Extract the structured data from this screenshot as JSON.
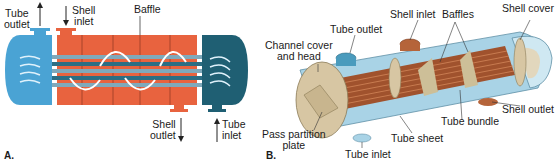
{
  "figure_a": {
    "panel_label": "A.",
    "labels": {
      "tube_outlet": [
        "Tube",
        "outlet"
      ],
      "shell_inlet": [
        "Shell",
        "inlet"
      ],
      "baffle": "Baffle",
      "shell_outlet": [
        "Shell",
        "outlet"
      ],
      "tube_inlet": [
        "Tube",
        "inlet"
      ]
    },
    "colors": {
      "tube_inlet_head": "#1f5f73",
      "tube_outlet_head": "#4aa3d4",
      "shell": "#e8633f",
      "tubes": "#2c6e84",
      "baffle": "#a8452a"
    }
  },
  "figure_b": {
    "panel_label": "B.",
    "labels": {
      "tube_outlet": "Tube outlet",
      "shell_inlet": "Shell inlet",
      "baffles": "Baffles",
      "shell_cover": "Shell cover",
      "channel_cover": [
        "Channel cover",
        "and head"
      ],
      "pass_partition": [
        "Pass partition",
        "plate"
      ],
      "tube_sheet": "Tube sheet",
      "tube_bundle": "Tube bundle",
      "shell_outlet": "Shell outlet",
      "tube_inlet": "Tube inlet"
    },
    "colors": {
      "shell_body": "#a9d3e6",
      "tube_bundle": "#a0522d",
      "head": "#d7c6a3",
      "nozzle_copper": "#b5643a"
    }
  }
}
